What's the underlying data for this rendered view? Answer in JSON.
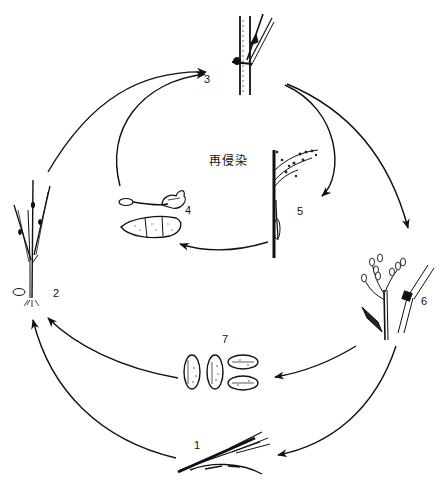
{
  "diagram": {
    "type": "disease-cycle",
    "center_label": "再侵染",
    "stages": [
      {
        "id": 1,
        "label": "1",
        "depicts": "infected straw / leaf debris (overwintering)"
      },
      {
        "id": 2,
        "label": "2",
        "depicts": "infected rice seedling"
      },
      {
        "id": 3,
        "label": "3",
        "depicts": "infected stem node"
      },
      {
        "id": 4,
        "label": "4",
        "depicts": "germinating conidium and conidium"
      },
      {
        "id": 5,
        "label": "5",
        "depicts": "infected panicle (neck blast)"
      },
      {
        "id": 6,
        "label": "6",
        "depicts": "infected panicle branches and node"
      },
      {
        "id": 7,
        "label": "7",
        "depicts": "infected grains / seeds"
      }
    ],
    "arrows": [
      {
        "from": 2,
        "to": 3
      },
      {
        "from": 4,
        "to": 3
      },
      {
        "from": 3,
        "to": 5
      },
      {
        "from": 3,
        "to": 6
      },
      {
        "from": 5,
        "to": 4
      },
      {
        "from": 6,
        "to": 7
      },
      {
        "from": 6,
        "to": 1
      },
      {
        "from": 7,
        "to": 2
      },
      {
        "from": 1,
        "to": 2
      }
    ],
    "colors": {
      "ink": "#111111",
      "background": "#ffffff"
    }
  }
}
